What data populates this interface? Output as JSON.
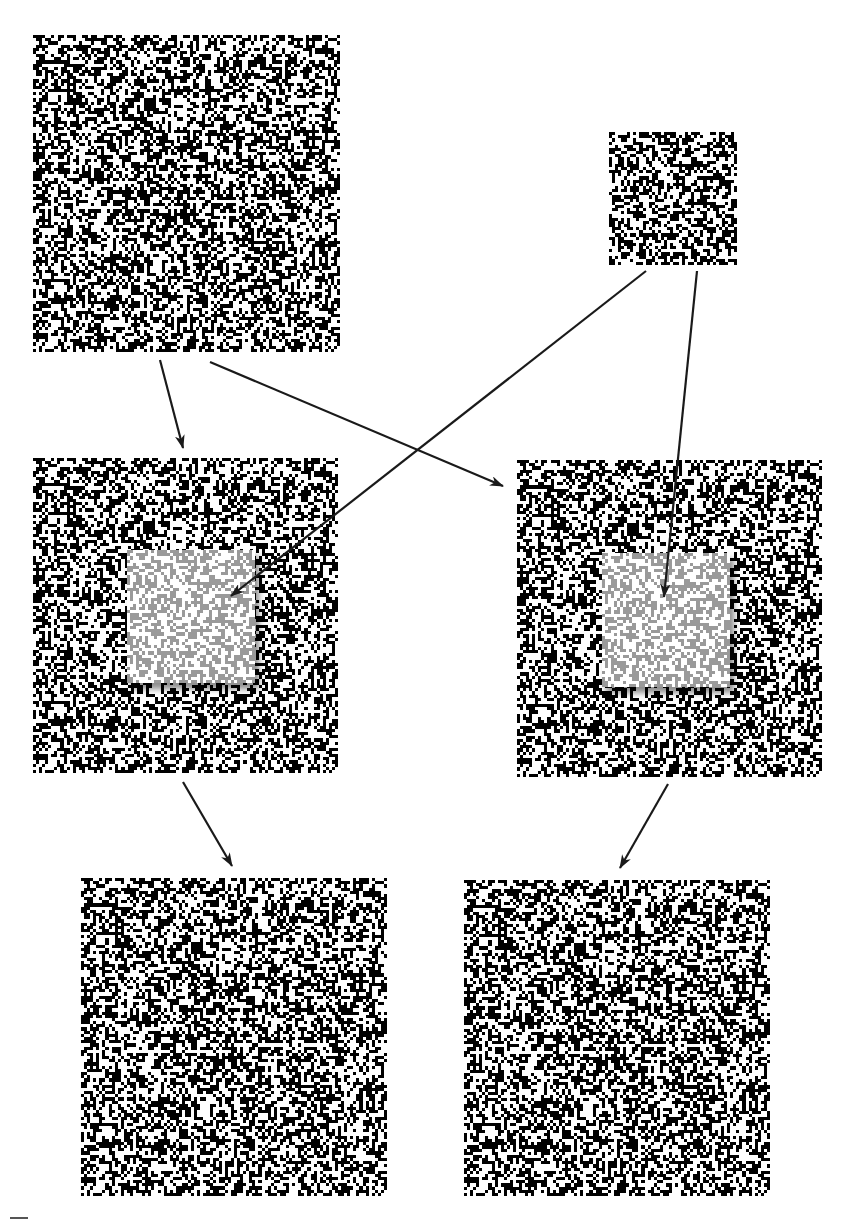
{
  "figure": {
    "colors": {
      "background": "#ffffff",
      "dot": "#000000",
      "inset_dot": "#9a9a9a",
      "arrow": "#1a1a1a"
    },
    "panels": [
      {
        "id": "source-large",
        "x": 33,
        "y": 35,
        "w": 307,
        "h": 317,
        "cells": 100,
        "seed": 11,
        "density": 0.5
      },
      {
        "id": "source-small",
        "x": 609,
        "y": 132,
        "w": 128,
        "h": 133,
        "cells": 42,
        "seed": 23,
        "density": 0.5
      },
      {
        "id": "combined-left",
        "x": 33,
        "y": 458,
        "w": 305,
        "h": 315,
        "cells": 100,
        "seed": 11,
        "density": 0.5,
        "inset": {
          "x": 127,
          "y": 550,
          "w": 128,
          "h": 133,
          "cells": 42,
          "seed": 23
        }
      },
      {
        "id": "combined-right",
        "x": 517,
        "y": 460,
        "w": 305,
        "h": 317,
        "cells": 100,
        "seed": 11,
        "density": 0.5,
        "inset": {
          "x": 602,
          "y": 553,
          "w": 128,
          "h": 134,
          "cells": 42,
          "seed": 23
        }
      },
      {
        "id": "output-left",
        "x": 81,
        "y": 878,
        "w": 306,
        "h": 318,
        "cells": 100,
        "seed": 11,
        "density": 0.5
      },
      {
        "id": "output-right",
        "x": 464,
        "y": 880,
        "w": 306,
        "h": 316,
        "cells": 100,
        "seed": 11,
        "density": 0.5
      }
    ],
    "arrows": [
      {
        "id": "large-to-combined-left",
        "x1": 160,
        "y1": 360,
        "x2": 183,
        "y2": 448
      },
      {
        "id": "large-to-combined-right",
        "x1": 210,
        "y1": 362,
        "x2": 503,
        "y2": 486
      },
      {
        "id": "small-to-combined-left-inset",
        "x1": 646,
        "y1": 271,
        "x2": 231,
        "y2": 596
      },
      {
        "id": "small-to-combined-right-inset",
        "x1": 697,
        "y1": 271,
        "x2": 664,
        "y2": 597
      },
      {
        "id": "combined-left-to-output-left",
        "x1": 183,
        "y1": 782,
        "x2": 232,
        "y2": 866
      },
      {
        "id": "combined-right-to-output-right",
        "x1": 668,
        "y1": 784,
        "x2": 620,
        "y2": 868
      }
    ],
    "caption_fragment_visible": true
  }
}
